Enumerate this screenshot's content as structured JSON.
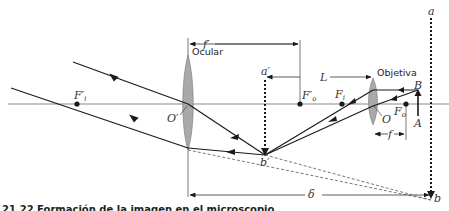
{
  "figure": {
    "caption": "21.22 Formación de la imagen en el microscopio",
    "lenses": {
      "ocular": {
        "label": "Ocular",
        "center_label": "O′"
      },
      "objetiva": {
        "label": "Objetiva",
        "center_label": "O"
      }
    },
    "points": {
      "f_prime_i": "F′",
      "f_prime_i_sub": "i",
      "f_prime_o": "F′",
      "f_prime_o_sub": "o",
      "f_i": "F",
      "f_i_sub": "i",
      "f_o": "F",
      "f_o_sub": "o",
      "A": "A",
      "B": "B",
      "b_prime": "b′",
      "b": "b",
      "a_prime": "a′",
      "a": "a"
    },
    "dimensions": {
      "f_prime": "f′",
      "L": "L",
      "f": "f",
      "delta": "δ"
    },
    "colors": {
      "line": "#1a1a1a",
      "axis": "#8a8a8a",
      "lens_fill": "#a9a9a9",
      "dashed": "#555555"
    }
  }
}
